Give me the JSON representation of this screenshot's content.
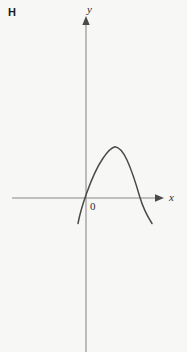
{
  "figure": {
    "panel_letter": "H",
    "background_color": "#f7f7f5",
    "axis_color": "#8a8a8a",
    "curve_color": "#4a4a4a",
    "text_color": "#2b2b2b",
    "width": 187,
    "height": 352
  },
  "labels": {
    "y_axis": "y",
    "x_axis": "x",
    "origin": "0"
  },
  "chart_data": {
    "type": "line",
    "title": "H",
    "xlabel": "x",
    "ylabel": "y",
    "grid": false,
    "legend": null,
    "annotations": [
      "0"
    ],
    "curve_shape": "parabola-concave-down",
    "axes": {
      "x_axis_pixel_y": 198,
      "y_axis_pixel_x": 86,
      "x_axis_pixel_range": [
        12,
        160
      ],
      "y_axis_pixel_range": [
        18,
        352
      ],
      "x_arrow": true,
      "y_arrow": true
    },
    "series": [
      {
        "name": "parabola",
        "points_pixel": [
          [
            78,
            223
          ],
          [
            80,
            213
          ],
          [
            82,
            206
          ],
          [
            85,
            198
          ],
          [
            88,
            190
          ],
          [
            92,
            180
          ],
          [
            96,
            171
          ],
          [
            100,
            163
          ],
          [
            104,
            157
          ],
          [
            108,
            151
          ],
          [
            113,
            147
          ],
          [
            118,
            147
          ],
          [
            123,
            151
          ],
          [
            128,
            159
          ],
          [
            133,
            172
          ],
          [
            137,
            184
          ],
          [
            140,
            198
          ],
          [
            145,
            208
          ],
          [
            149,
            216
          ],
          [
            152,
            223
          ]
        ],
        "vertex_pixel": [
          115,
          147
        ],
        "x_intercepts_pixel": [
          85,
          140
        ]
      }
    ]
  }
}
